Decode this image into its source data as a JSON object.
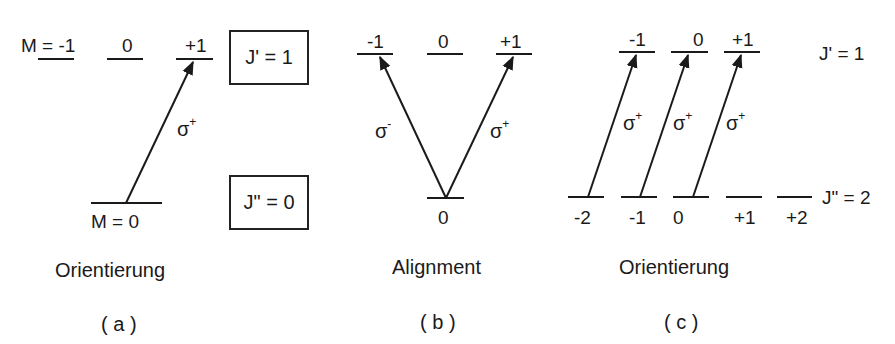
{
  "panels": {
    "a": {
      "upper_levels": [
        "M = -1",
        "0",
        "+1"
      ],
      "lower_level": "M = 0",
      "upper_state_label": "J' = 1",
      "lower_state_label": "J\" = 0",
      "transition": "σ+",
      "title": "Orientierung",
      "caption": "( a )"
    },
    "b": {
      "upper_levels": [
        "-1",
        "0",
        "+1"
      ],
      "lower_level": "0",
      "transitions": [
        "σ-",
        "σ+"
      ],
      "title": "Alignment",
      "caption": "( b )"
    },
    "c": {
      "upper_levels": [
        "-1",
        "0",
        "+1"
      ],
      "lower_levels": [
        "-2",
        "-1",
        "0",
        "+1",
        "+2"
      ],
      "upper_state_label": "J' = 1",
      "lower_state_label": "J\" = 2",
      "transitions": [
        "σ+",
        "σ+",
        "σ+"
      ],
      "title": "Orientierung",
      "caption": "( c )"
    }
  },
  "sigma": "σ",
  "sup_plus": "+",
  "sup_minus": "-"
}
